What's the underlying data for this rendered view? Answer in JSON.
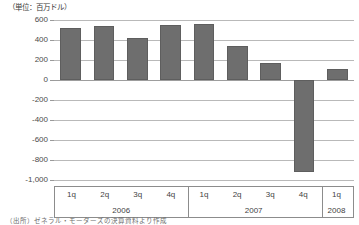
{
  "unit_caption": "（単位：百万ドル）",
  "source_note": "（出所）ゼネラル・モーターズの決算資料より作成",
  "colors": {
    "bar_fill": "#6e6e6e",
    "bar_border": "#5e5e5e",
    "gridline": "#b9b9b9",
    "axis_line": "#8c8c8c",
    "background": "#ffffff",
    "text": "#3f3f3f"
  },
  "axis": {
    "y_ticks": [
      "600",
      "400",
      "200",
      "0",
      "-200",
      "-400",
      "-600",
      "-800",
      "-1,000"
    ],
    "y_tick_values": [
      600,
      400,
      200,
      0,
      -200,
      -400,
      -600,
      -800,
      -1000
    ]
  },
  "xaxis": {
    "quarters": [
      "1q",
      "2q",
      "3q",
      "4q",
      "1q",
      "2q",
      "3q",
      "4q",
      "1q"
    ],
    "years": [
      "2006",
      "2007",
      "2008"
    ],
    "year_spans": [
      4,
      4,
      1
    ]
  },
  "chart_data": {
    "type": "bar",
    "title": "",
    "subtitle": "",
    "xlabel": "",
    "ylabel": "（単位：百万ドル）",
    "categories": [
      "1q 2006",
      "2q 2006",
      "3q 2006",
      "4q 2006",
      "1q 2007",
      "2q 2007",
      "3q 2007",
      "4q 2007",
      "1q 2008"
    ],
    "tick_labels": [
      "1q",
      "2q",
      "3q",
      "4q",
      "1q",
      "2q",
      "3q",
      "4q",
      "1q"
    ],
    "group_labels": [
      "2006",
      "2007",
      "2008"
    ],
    "values": [
      520,
      545,
      425,
      555,
      560,
      340,
      175,
      -920,
      110
    ],
    "ylim": [
      -1000,
      600
    ],
    "yticks": [
      600,
      400,
      200,
      0,
      -200,
      -400,
      -600,
      -800,
      -1000
    ],
    "grid": true,
    "legend": "none",
    "series": [
      {
        "name": "quarterly-result",
        "values": [
          520,
          545,
          425,
          555,
          560,
          340,
          175,
          -920,
          110
        ]
      }
    ]
  }
}
